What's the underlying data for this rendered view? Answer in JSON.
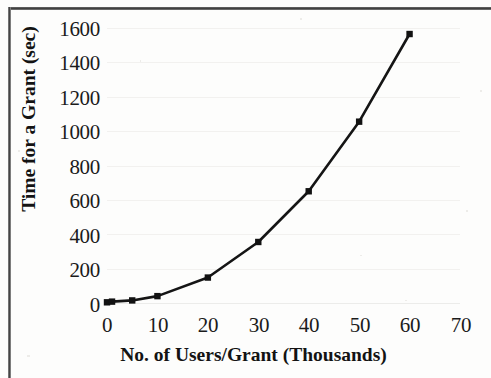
{
  "chart_data": {
    "type": "line",
    "title": "",
    "xlabel": "No. of Users/Grant (Thousands)",
    "ylabel": "Time for a Grant (sec)",
    "xlim": [
      0,
      70
    ],
    "ylim": [
      0,
      1600
    ],
    "xticks": [
      0,
      10,
      20,
      30,
      40,
      50,
      60,
      70
    ],
    "xtick_labels": [
      "0",
      "10",
      "20",
      "30",
      "40",
      "50",
      "60",
      "70"
    ],
    "yticks": [
      0,
      200,
      400,
      600,
      800,
      1000,
      1200,
      1400,
      1600
    ],
    "ytick_labels": [
      "0",
      "200",
      "400",
      "600",
      "800",
      "1000",
      "1200",
      "1400",
      "1600"
    ],
    "grid": true,
    "grid_axis": "y",
    "legend": false,
    "legend_position": "none",
    "marker": "square",
    "line_color": "#151515",
    "marker_color": "#121212",
    "series": [
      {
        "name": "Time for a Grant",
        "x": [
          0,
          1,
          5,
          10,
          20,
          30,
          40,
          50,
          60
        ],
        "values": [
          4,
          8,
          15,
          40,
          148,
          355,
          650,
          1055,
          1565
        ]
      }
    ]
  },
  "figure": {
    "frame_color": "#3a3a3a",
    "background": "#fdfdfc",
    "gridline_color": "#ececea"
  }
}
